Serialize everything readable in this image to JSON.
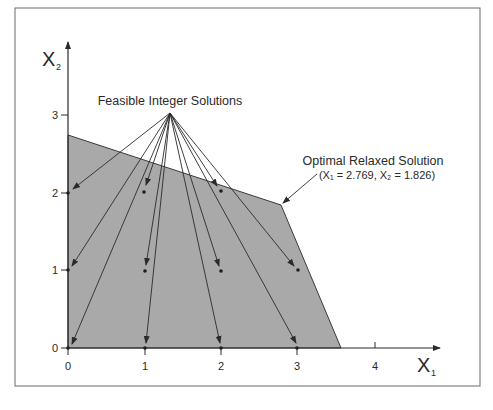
{
  "colors": {
    "feasible_region": "#a9a9a9",
    "stroke": "#3a3a3a",
    "background": "#ffffff",
    "frame": "#6a6a6a"
  },
  "axes": {
    "x_label": "X",
    "x_sub": "1",
    "y_label": "X",
    "y_sub": "2",
    "x_ticks": [
      "0",
      "1",
      "2",
      "3",
      "4"
    ],
    "y_ticks": [
      "0",
      "1",
      "2",
      "3"
    ]
  },
  "annotations": {
    "feasible_label": "Feasible Integer Solutions",
    "optimal_label": "Optimal Relaxed Solution",
    "optimal_values": "(X₁ = 2.769, X₂ = 1.826)"
  },
  "feasible_region": {
    "vertices": [
      [
        0,
        0
      ],
      [
        0,
        2.75
      ],
      [
        2.769,
        1.826
      ],
      [
        3.55,
        0
      ]
    ]
  },
  "integer_points": [
    [
      0,
      0
    ],
    [
      1,
      0
    ],
    [
      2,
      0
    ],
    [
      3,
      0
    ],
    [
      0,
      1
    ],
    [
      1,
      1
    ],
    [
      2,
      1
    ],
    [
      3,
      1
    ],
    [
      0,
      2
    ],
    [
      1,
      2
    ],
    [
      2,
      2
    ]
  ],
  "optimal_point": [
    2.769,
    1.826
  ]
}
